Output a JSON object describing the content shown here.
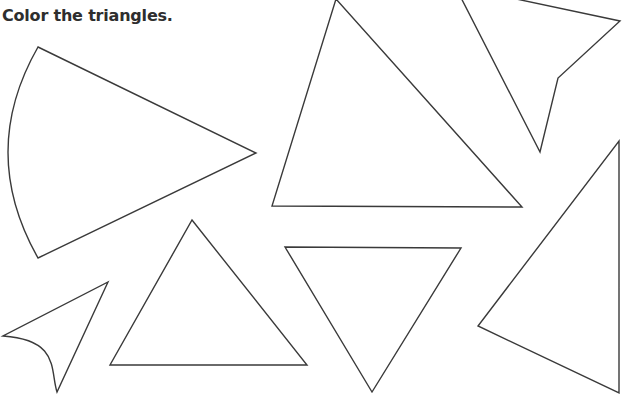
{
  "worksheet": {
    "instruction": "Color the triangles.",
    "stroke_color": "#3a3a3a",
    "background_color": "#ffffff"
  },
  "shapes": [
    {
      "id": "sector",
      "kind": "curved-wedge",
      "is_triangle": false,
      "path": "M38,47 L256,153 L38,258 Q-22,152 38,47 Z"
    },
    {
      "id": "large-triangle",
      "kind": "triangle",
      "is_triangle": true,
      "path": "M336,-1 L522,207 L272,206 Z"
    },
    {
      "id": "arrowhead",
      "kind": "concave-quadrilateral",
      "is_triangle": false,
      "path": "M455,-14 L620,21 L558,78 L540,152 Z"
    },
    {
      "id": "right-triangle",
      "kind": "triangle",
      "is_triangle": true,
      "path": "M619,141 L619,393 L478,326 Z"
    },
    {
      "id": "inverted-triangle",
      "kind": "triangle",
      "is_triangle": true,
      "path": "M285,247 L461,248 L372,392 Z"
    },
    {
      "id": "upright-triangle",
      "kind": "triangle",
      "is_triangle": true,
      "path": "M192,220 L307,365 L110,365 Z"
    },
    {
      "id": "curved-dart",
      "kind": "curved-shape",
      "is_triangle": false,
      "path": "M108,282 L57,392 C50,370 60,340 3,336 Z"
    }
  ]
}
